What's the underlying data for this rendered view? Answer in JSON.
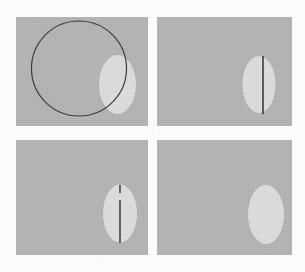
{
  "figure": {
    "title": "",
    "caption": "",
    "background_color": "#fbfbfb",
    "panel_color": "#b5b5b5",
    "blob_color": "#dedede",
    "line_color": "#2b2b2b",
    "outline_color": "#3a3a3a",
    "panel_count": 4,
    "layout": "2x2 grid"
  },
  "panels": [
    {
      "id": "panel-top-left",
      "label": "",
      "position": "top-left",
      "x": 16,
      "y": 17,
      "width": 132,
      "height": 109,
      "background_color": "#b5b5b5",
      "shapes": [
        {
          "kind": "blob",
          "name": "bright-region",
          "cx": 117.5,
          "cy": 84.5,
          "rx": 18.5,
          "ry": 29.5,
          "color": "#dedede"
        },
        {
          "kind": "circle-outline",
          "name": "fitted-circle",
          "cx": 79,
          "cy": 68.5,
          "r": 47.5,
          "stroke": "#3a3a3a",
          "stroke_width": 1.2
        }
      ]
    },
    {
      "id": "panel-top-right",
      "label": "",
      "position": "top-right",
      "x": 157,
      "y": 17,
      "width": 135,
      "height": 109,
      "background_color": "#b5b5b5",
      "shapes": [
        {
          "kind": "blob",
          "name": "bright-region",
          "cx": 259,
          "cy": 84.5,
          "rx": 16.5,
          "ry": 28.5,
          "color": "#dedede"
        },
        {
          "kind": "line",
          "name": "axis-line",
          "x1": 263,
          "y1": 56,
          "x2": 263,
          "y2": 114,
          "stroke": "#2b2b2b",
          "stroke_width": 1.5
        }
      ]
    },
    {
      "id": "panel-bottom-left",
      "label": "",
      "position": "bottom-left",
      "x": 16,
      "y": 140,
      "width": 132,
      "height": 115,
      "background_color": "#b5b5b5",
      "shapes": [
        {
          "kind": "blob",
          "name": "bright-region",
          "cx": 120,
          "cy": 213.5,
          "rx": 17,
          "ry": 29,
          "color": "#dedede"
        },
        {
          "kind": "line",
          "name": "axis-line-top-segment",
          "x1": 120,
          "y1": 185,
          "x2": 120,
          "y2": 193,
          "stroke": "#2b2b2b",
          "stroke_width": 1.4
        },
        {
          "kind": "line",
          "name": "axis-line-main-segment",
          "x1": 120,
          "y1": 200,
          "x2": 120,
          "y2": 243,
          "stroke": "#2b2b2b",
          "stroke_width": 1.4
        }
      ]
    },
    {
      "id": "panel-bottom-right",
      "label": "",
      "position": "bottom-right",
      "x": 157,
      "y": 140,
      "width": 135,
      "height": 115,
      "background_color": "#b5b5b5",
      "shapes": [
        {
          "kind": "blob",
          "name": "bright-region",
          "cx": 266,
          "cy": 214.5,
          "rx": 18,
          "ry": 29.5,
          "color": "#dedede"
        }
      ]
    }
  ]
}
